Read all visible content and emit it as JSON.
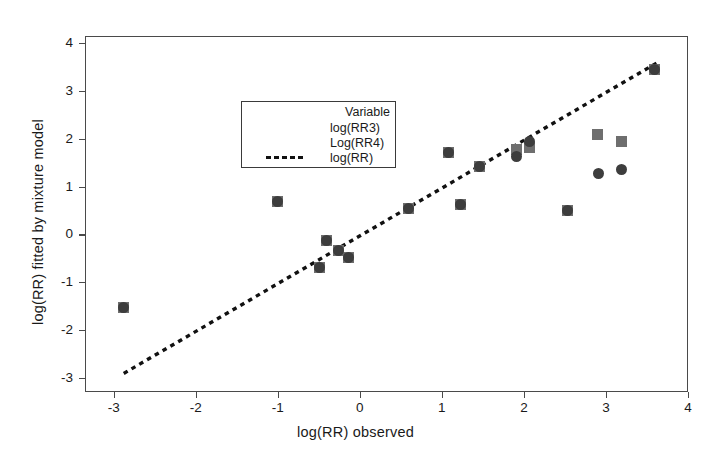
{
  "chart_data": {
    "type": "scatter",
    "title": "",
    "xlabel": "log(RR) observed",
    "ylabel": "log(RR) fitted by mixture model",
    "xlim": [
      -3.35,
      4.0
    ],
    "ylim": [
      -3.3,
      4.15
    ],
    "xticks": [
      -3,
      -2,
      -1,
      0,
      1,
      2,
      3,
      4
    ],
    "yticks": [
      -3,
      -2,
      -1,
      0,
      1,
      2,
      3,
      4
    ],
    "xticklabels": [
      "-3",
      "-2",
      "-1",
      "0",
      "1",
      "2",
      "3",
      "4"
    ],
    "yticklabels": [
      "-3",
      "-2",
      "-1",
      "0",
      "1",
      "2",
      "3",
      "4"
    ],
    "grid": false,
    "legend_position": "upper-left",
    "legend_title": "Variable",
    "series": [
      {
        "name": "log(RR3)",
        "marker": "circle",
        "color": "#3d3d3d",
        "points": [
          {
            "x": -2.89,
            "y": -1.51
          },
          {
            "x": -1.01,
            "y": 0.71
          },
          {
            "x": -0.5,
            "y": -0.67
          },
          {
            "x": -0.42,
            "y": -0.1
          },
          {
            "x": -0.27,
            "y": -0.31
          },
          {
            "x": -0.15,
            "y": -0.46
          },
          {
            "x": 0.58,
            "y": 0.57
          },
          {
            "x": 1.07,
            "y": 1.74
          },
          {
            "x": 1.22,
            "y": 0.65
          },
          {
            "x": 1.45,
            "y": 1.43
          },
          {
            "x": 1.9,
            "y": 1.65
          },
          {
            "x": 2.06,
            "y": 1.97
          },
          {
            "x": 2.52,
            "y": 0.52
          },
          {
            "x": 2.9,
            "y": 1.3
          },
          {
            "x": 3.18,
            "y": 1.38
          },
          {
            "x": 3.58,
            "y": 3.48
          }
        ]
      },
      {
        "name": "Log(RR4)",
        "marker": "square",
        "color": "#6e6e6e",
        "points": [
          {
            "x": -2.89,
            "y": -1.51
          },
          {
            "x": -1.01,
            "y": 0.71
          },
          {
            "x": -0.5,
            "y": -0.67
          },
          {
            "x": -0.42,
            "y": -0.1
          },
          {
            "x": -0.27,
            "y": -0.31
          },
          {
            "x": -0.15,
            "y": -0.46
          },
          {
            "x": 0.58,
            "y": 0.57
          },
          {
            "x": 1.07,
            "y": 1.74
          },
          {
            "x": 1.22,
            "y": 0.65
          },
          {
            "x": 1.45,
            "y": 1.43
          },
          {
            "x": 1.9,
            "y": 1.8
          },
          {
            "x": 2.06,
            "y": 1.84
          },
          {
            "x": 2.52,
            "y": 0.52
          },
          {
            "x": 2.89,
            "y": 2.12
          },
          {
            "x": 3.18,
            "y": 1.96
          },
          {
            "x": 3.58,
            "y": 3.48
          }
        ]
      }
    ],
    "reference_line": {
      "name": "log(RR)",
      "style": "dotted",
      "color": "#111111",
      "x0": -2.89,
      "y0": -2.89,
      "x1": 3.62,
      "y1": 3.62
    }
  },
  "legend": {
    "title": "Variable",
    "entries": [
      {
        "label": "log(RR3)",
        "icon": "filled-circle-marker"
      },
      {
        "label": "Log(RR4)",
        "icon": "filled-square-marker"
      },
      {
        "label": "log(RR)",
        "icon": "dotted-line-marker"
      }
    ]
  }
}
